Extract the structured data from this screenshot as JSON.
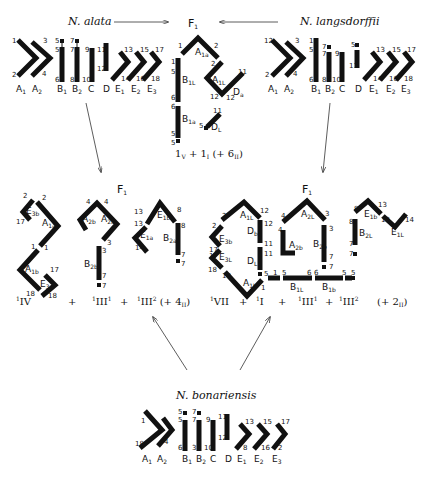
{
  "parents": {
    "alata": {
      "title": "N. alata",
      "labels": [
        "A1",
        "A2",
        "B1",
        "B2",
        "C",
        "D",
        "E1",
        "E2",
        "E3"
      ]
    },
    "langsdorffii": {
      "title": "N. langsdorffii",
      "labels": [
        "A1",
        "A2",
        "B1",
        "B2",
        "C",
        "D",
        "E1",
        "E2",
        "E3"
      ]
    },
    "bonariensis": {
      "title": "N. bonariensis",
      "labels": [
        "A1",
        "A2",
        "B1",
        "B2",
        "C",
        "D",
        "E1",
        "E2",
        "E3"
      ]
    }
  },
  "hybrids": {
    "top": {
      "title": "F1",
      "formula": "1V + 1I (+ 6II)",
      "segments": [
        "A1a",
        "A1L",
        "B1L",
        "B1a",
        "Da",
        "DL"
      ]
    },
    "left": {
      "title": "F1",
      "formula": "1IV + 1III1 + 1III2 (+ 4II)",
      "formula_parts": [
        "IV",
        "+",
        "III",
        "1",
        "+",
        "III",
        "2",
        "(+ 4II)"
      ],
      "segments": [
        "E3b",
        "A1a",
        "A1b",
        "E3a",
        "A2b",
        "A2a",
        "B2b",
        "E1b",
        "E1a",
        "B2a"
      ]
    },
    "right": {
      "title": "F1",
      "formula": "1VII + 1I + 1III1 + 1III2 (+ 2II)",
      "formula_parts": [
        "VII",
        "+",
        "I",
        "+",
        "III",
        "1",
        "+",
        "III",
        "2",
        "(+ 2II)"
      ],
      "segments": [
        "A1L",
        "E3b",
        "Db",
        "E3L",
        "DL",
        "A1b",
        "B1L",
        "B1b",
        "A2L",
        "A2b",
        "B2b",
        "E1b",
        "B2L",
        "E1L"
      ]
    }
  },
  "arrows": [
    {
      "from": "N. alata",
      "to": "F1 top"
    },
    {
      "from": "N. langsdorffii",
      "to": "F1 top"
    },
    {
      "from": "N. alata",
      "to": "F1 left"
    },
    {
      "from": "N. langsdorffii",
      "to": "F1 right"
    },
    {
      "from": "N. bonariensis",
      "to": "F1 left"
    },
    {
      "from": "N. bonariensis",
      "to": "F1 right"
    }
  ]
}
